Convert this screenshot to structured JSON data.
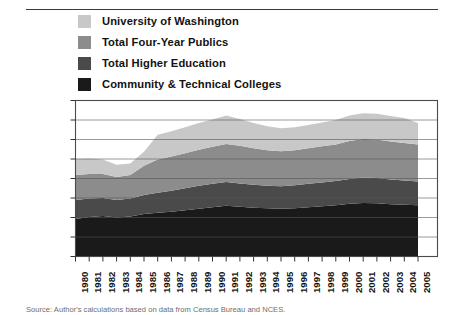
{
  "figure": {
    "top_rule": "horizontal-rule",
    "source_note": "Source: Author's calculations based on data from Census Bureau and NCES."
  },
  "legend": {
    "position": "above-plot",
    "items": [
      {
        "label": "University of Washington",
        "color": "#c8c8c8",
        "swatch": "legend-swatch"
      },
      {
        "label": "Total Four-Year Publics",
        "color": "#8c8c8c",
        "swatch": "legend-swatch"
      },
      {
        "label": "Total Higher Education",
        "color": "#4a4a4a",
        "swatch": "legend-swatch"
      },
      {
        "label": "Community & Technical Colleges",
        "color": "#1a1a1a",
        "swatch": "legend-swatch"
      }
    ]
  },
  "chart_data": {
    "type": "area",
    "stacked": true,
    "title": "",
    "subtitle": "",
    "xlabel": "",
    "ylabel": "",
    "grid": true,
    "legend_position": "top",
    "ylim": [
      0,
      16000
    ],
    "ytick_step": 2000,
    "ytick_labels": [
      "$0",
      "$2,000",
      "$4,000",
      "$6,000",
      "$8,000",
      "$10,000",
      "$12,000",
      "$14,000",
      "$16,000"
    ],
    "ytick_values": [
      0,
      2000,
      4000,
      6000,
      8000,
      10000,
      12000,
      14000,
      16000
    ],
    "x": [
      1980,
      1981,
      1982,
      1983,
      1984,
      1985,
      1986,
      1987,
      1988,
      1989,
      1990,
      1991,
      1992,
      1993,
      1994,
      1995,
      1996,
      1997,
      1998,
      1999,
      2000,
      2001,
      2002,
      2003,
      2004,
      2005
    ],
    "categories": [
      "1980",
      "1981",
      "1982",
      "1983",
      "1984",
      "1985",
      "1986",
      "1987",
      "1988",
      "1989",
      "1990",
      "1991",
      "1992",
      "1993",
      "1994",
      "1995",
      "1996",
      "1997",
      "1998",
      "1999",
      "2000",
      "2001",
      "2002",
      "2003",
      "2004",
      "2005"
    ],
    "series": [
      {
        "name": "Community & Technical Colleges",
        "color": "#1a1a1a",
        "values": [
          3850,
          4050,
          4150,
          4000,
          4100,
          4350,
          4500,
          4600,
          4750,
          4900,
          5050,
          5200,
          5100,
          5000,
          4950,
          4900,
          4950,
          5050,
          5150,
          5250,
          5400,
          5500,
          5450,
          5350,
          5300,
          5250
        ]
      },
      {
        "name": "Total Higher Education",
        "color": "#4a4a4a",
        "values": [
          1950,
          1900,
          1850,
          1800,
          1850,
          1950,
          2050,
          2150,
          2250,
          2350,
          2400,
          2450,
          2400,
          2350,
          2300,
          2300,
          2350,
          2400,
          2450,
          2500,
          2550,
          2600,
          2600,
          2550,
          2500,
          2450
        ]
      },
      {
        "name": "Total Four-Year Publics",
        "color": "#8c8c8c",
        "values": [
          2550,
          2500,
          2450,
          2350,
          2400,
          3000,
          3400,
          3500,
          3600,
          3700,
          3800,
          3900,
          3850,
          3750,
          3650,
          3600,
          3600,
          3650,
          3700,
          3750,
          3900,
          3950,
          3950,
          3900,
          3850,
          3800
        ]
      },
      {
        "name": "University of Washington",
        "color": "#c8c8c8",
        "values": [
          1650,
          1600,
          1500,
          1250,
          1200,
          1450,
          2550,
          2600,
          2650,
          2750,
          2800,
          2900,
          2750,
          2600,
          2450,
          2350,
          2350,
          2400,
          2450,
          2500,
          2600,
          2650,
          2650,
          2600,
          2550,
          2200
        ]
      }
    ],
    "stack_totals": [
      10000,
      10050,
      9950,
      9400,
      9550,
      10750,
      12500,
      12850,
      13250,
      13700,
      14050,
      14450,
      14100,
      13700,
      13350,
      13150,
      13250,
      13500,
      13750,
      14000,
      14450,
      14700,
      14650,
      14400,
      14200,
      13700
    ]
  }
}
